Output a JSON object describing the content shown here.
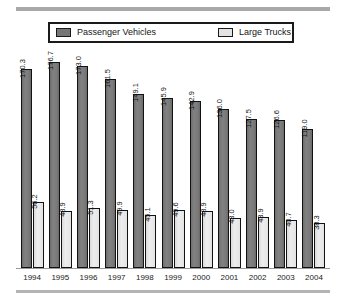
{
  "legend": {
    "entries": [
      {
        "label": "Passenger Vehicles",
        "swatch": "dark-gray-swatch",
        "color": "#767676"
      },
      {
        "label": "Large Trucks",
        "swatch": "light-gray-swatch",
        "color": "#e3e3e3"
      }
    ]
  },
  "chart_data": {
    "type": "bar",
    "title": "",
    "subtitle": "",
    "xlabel": "",
    "ylabel": "",
    "grid": false,
    "legend_position": "top",
    "ylim": [
      0,
      185
    ],
    "categories": [
      "1994",
      "1995",
      "1996",
      "1997",
      "1998",
      "1999",
      "2000",
      "2001",
      "2002",
      "2003",
      "2004"
    ],
    "series": [
      {
        "name": "Passenger Vehicles",
        "color": "#767676",
        "values": [
          170.3,
          176.7,
          173.0,
          161.5,
          149.1,
          145.9,
          142.9,
          136.0,
          127.5,
          126.6,
          119.0
        ],
        "labels": [
          "170.3",
          "176.7",
          "173.0",
          "161.5",
          "149.1",
          "145.9",
          "142.9",
          "136.0",
          "127.5",
          "126.6",
          "119.0"
        ]
      },
      {
        "name": "Large Trucks",
        "color": "#e3e3e3",
        "values": [
          56.2,
          48.9,
          51.3,
          49.9,
          45.1,
          49.6,
          48.9,
          43.0,
          43.9,
          40.7,
          38.3
        ],
        "labels": [
          "56.2",
          "48.9",
          "51.3",
          "49.9",
          "45.1",
          "49.6",
          "48.9",
          "43.0",
          "43.9",
          "40.7",
          "38.3"
        ]
      }
    ]
  }
}
